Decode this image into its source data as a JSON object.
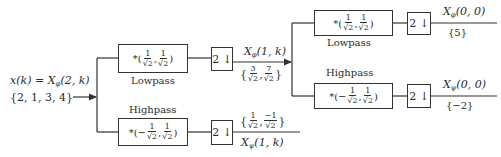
{
  "input": {
    "signal_label": "x(k) = X",
    "signal_sub": "φ",
    "signal_args": "(2, k)",
    "values": "{2, 1, 3, 4}"
  },
  "stage1": {
    "lowpass": {
      "label": "Lowpass",
      "coef_prefix": "*(",
      "coef1_num": "1",
      "coef1_den": "√2",
      "coef2_num": "1",
      "coef2_den": "√2",
      "coef_suffix": ")",
      "downsample": "2 ↓",
      "output_label": "X",
      "output_sub": "φ",
      "output_args": "(1, k)",
      "output_values": {
        "open": "{",
        "v1_num": "3",
        "v1_den": "√2",
        "v2_num": "7",
        "v2_den": "√2",
        "close": "}"
      }
    },
    "highpass": {
      "label": "Highpass",
      "coef_prefix": "*(−",
      "coef1_num": "1",
      "coef1_den": "√2",
      "coef2_num": "1",
      "coef2_den": "√2",
      "coef_suffix": ")",
      "downsample": "2 ↓",
      "output_label": "X",
      "output_sub": "ψ",
      "output_args": "(1, k)",
      "output_values": {
        "open": "{",
        "v1_num": "1",
        "v1_den": "√2",
        "v2_num": "−1",
        "v2_den": "√2",
        "close": "}"
      }
    }
  },
  "stage2": {
    "lowpass": {
      "label": "Lowpass",
      "coef_prefix": "*(",
      "coef1_num": "1",
      "coef1_den": "√2",
      "coef2_num": "1",
      "coef2_den": "√2",
      "coef_suffix": ")",
      "downsample": "2 ↓",
      "output_label": "X",
      "output_sub": "φ",
      "output_args": "(0, 0)",
      "output_values": "{5}"
    },
    "highpass": {
      "label": "Highpass",
      "coef_prefix": "*(−",
      "coef1_num": "1",
      "coef1_den": "√2",
      "coef2_num": "1",
      "coef2_den": "√2",
      "coef_suffix": ")",
      "downsample": "2 ↓",
      "output_label": "X",
      "output_sub": "ψ",
      "output_args": "(0, 0)",
      "output_values": "{−2}"
    }
  },
  "colors": {
    "line": "#333333",
    "text": "#2a2a2a",
    "background": "#ffffff"
  }
}
